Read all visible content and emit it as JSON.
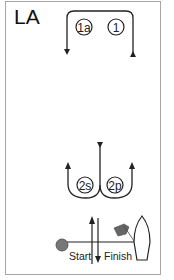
{
  "course": {
    "title": "LA"
  },
  "marks": [
    {
      "id": "1a",
      "label": "1a"
    },
    {
      "id": "1",
      "label": "1"
    },
    {
      "id": "2s",
      "label": "2s"
    },
    {
      "id": "2p",
      "label": "2p"
    }
  ],
  "start_finish": {
    "start_label": "Start",
    "finish_label": "Finish"
  },
  "colors": {
    "line": "#222222",
    "border": "#a6a6a6",
    "mark_fill": "#777777",
    "flag_fill": "#666666"
  }
}
